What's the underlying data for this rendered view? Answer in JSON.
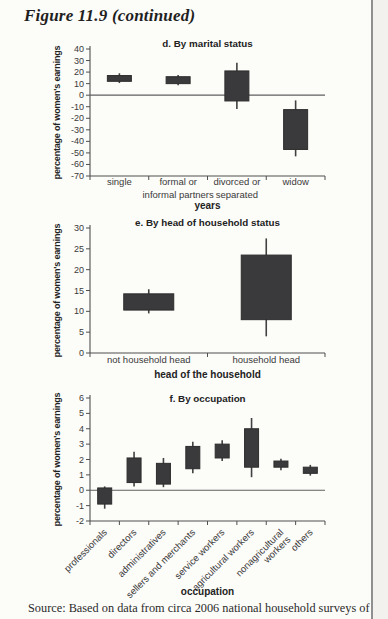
{
  "page": {
    "figure_title": "Figure 11.9 (continued)",
    "source_line": "Source: Based on data from circa 2006 national household surveys of Costa"
  },
  "colors": {
    "box_fill": "#3a3a3c",
    "box_stroke": "#2d2d2d",
    "whisker": "#414141",
    "axis": "#4f4f4f",
    "zero_line": "#5f5f5f",
    "page_bg": "#fcfcf9",
    "edge_line": "#8f8f8f"
  },
  "chart_data": [
    {
      "id": "d",
      "type": "box",
      "title": "d. By marital status",
      "ylabel": "percentage of women's earnings",
      "xlabel": "years",
      "ylim": [
        -70,
        40
      ],
      "yticks": [
        40,
        30,
        20,
        10,
        0,
        -10,
        -20,
        -30,
        -40,
        -50,
        -60,
        -70
      ],
      "zero_line": true,
      "rotated_labels": false,
      "categories": [
        "single",
        "formal or\ninformal partners",
        "divorced or\nseparated",
        "widow"
      ],
      "boxes": [
        {
          "whisker_low": 10.5,
          "box_low": 12,
          "box_high": 17,
          "whisker_high": 19
        },
        {
          "whisker_low": 8.5,
          "box_low": 10,
          "box_high": 16,
          "whisker_high": 17.5
        },
        {
          "whisker_low": -12,
          "box_low": -5,
          "box_high": 21,
          "whisker_high": 28
        },
        {
          "whisker_low": -53,
          "box_low": -47,
          "box_high": -12.5,
          "whisker_high": -4.5
        }
      ]
    },
    {
      "id": "e",
      "type": "box",
      "title": "e. By head of household status",
      "ylabel": "percentage of women's earnings",
      "xlabel": "head of the household",
      "ylim": [
        0,
        30
      ],
      "yticks": [
        30,
        25,
        20,
        15,
        10,
        5,
        0
      ],
      "zero_line": false,
      "rotated_labels": false,
      "categories": [
        "not household head",
        "household head"
      ],
      "boxes": [
        {
          "whisker_low": 9.5,
          "box_low": 10.3,
          "box_high": 14.2,
          "whisker_high": 15.3
        },
        {
          "whisker_low": 4,
          "box_low": 8,
          "box_high": 23.5,
          "whisker_high": 27.5
        }
      ]
    },
    {
      "id": "f",
      "type": "box",
      "title": "f. By occupation",
      "ylabel": "percentage of women's earnings",
      "xlabel": "occupation",
      "ylim": [
        -2,
        6
      ],
      "yticks": [
        6,
        5,
        4,
        3,
        2,
        1,
        0,
        -1,
        -2
      ],
      "zero_line": true,
      "rotated_labels": true,
      "categories": [
        "professionals",
        "directors",
        "administratives",
        "sellers and merchants",
        "service workers",
        "agricultural workers",
        "nonagricultural\nworkers",
        "others"
      ],
      "boxes": [
        {
          "whisker_low": -1.2,
          "box_low": -0.9,
          "box_high": 0.15,
          "whisker_high": 0.25
        },
        {
          "whisker_low": 0.25,
          "box_low": 0.5,
          "box_high": 2.1,
          "whisker_high": 2.5
        },
        {
          "whisker_low": 0.2,
          "box_low": 0.4,
          "box_high": 1.75,
          "whisker_high": 2.1
        },
        {
          "whisker_low": 1.1,
          "box_low": 1.4,
          "box_high": 2.85,
          "whisker_high": 3.15
        },
        {
          "whisker_low": 1.9,
          "box_low": 2.1,
          "box_high": 3.0,
          "whisker_high": 3.25
        },
        {
          "whisker_low": 0.85,
          "box_low": 1.5,
          "box_high": 4.0,
          "whisker_high": 4.7
        },
        {
          "whisker_low": 1.3,
          "box_low": 1.5,
          "box_high": 1.9,
          "whisker_high": 2.05
        },
        {
          "whisker_low": 0.95,
          "box_low": 1.1,
          "box_high": 1.5,
          "whisker_high": 1.65
        }
      ]
    }
  ]
}
